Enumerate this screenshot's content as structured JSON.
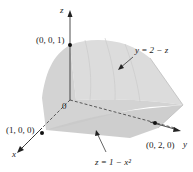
{
  "diagram": {
    "type": "3d-solid-region",
    "axes": {
      "x": "x",
      "y": "y",
      "z": "z"
    },
    "origin_label": "0",
    "points": [
      {
        "label": "(0, 0, 1)"
      },
      {
        "label": "(1, 0, 0)"
      },
      {
        "label": "(0, 2, 0)"
      }
    ],
    "surfaces": [
      {
        "label": "y = 2 − z"
      },
      {
        "label": "z = 1 − x²"
      }
    ],
    "colors": {
      "solid_fill": "#d9d9d9",
      "solid_shade": "#c4c4c4",
      "axis": "#222222"
    }
  }
}
